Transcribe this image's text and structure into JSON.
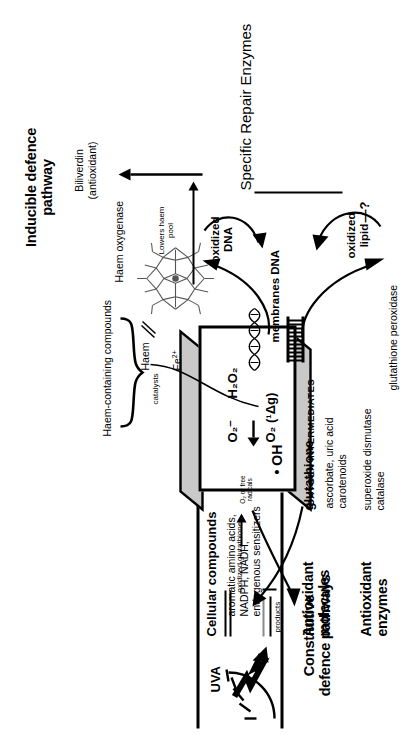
{
  "figure": {
    "kind": "biochemical-pathway-diagram",
    "title_left": "Constitutive\ndefence pathways",
    "orientation_note": "diagram rotated 90 degrees in the page"
  },
  "panel_inducible": {
    "heading_line1": "Inducible defence",
    "heading_line2": "pathway",
    "enzyme": "Haem oxygenase",
    "arrow_label_line1": "Lowers haem",
    "arrow_label_line2": "pool",
    "substrate": "Haem",
    "iron": "Fe",
    "iron_charge": "2+",
    "product_line1": "Biliverdin",
    "product_line2": "(antioxidant)",
    "source_pool": "Haem-containing compounds",
    "brace_label": "catalysts",
    "haem_structure_name": "haem-porphyrin-structure"
  },
  "panel_source": {
    "uva_label": "UVA",
    "sun_icon": "sun-with-rays-icon",
    "bolt_icon": "uva-lightning-arrow-icon",
    "heading": "Cellular compounds",
    "list": [
      "aromatic amino acids,",
      "NADPH, NADH,",
      "endogenous sensitizers"
    ]
  },
  "oxygen_box": {
    "edge_label": "OXYGEN INTERMEDIATES",
    "species": [
      {
        "formula": "H",
        "sub1": "2",
        "mid": "O",
        "sub2": "2",
        "name": "hydrogen-peroxide"
      },
      {
        "formula": "O",
        "sub": "2",
        "sup": "–",
        "name": "superoxide-anion"
      },
      {
        "formula": "O",
        "sub": "2",
        "state": "(¹Δ",
        "state_sub": "g",
        "state_close": ")",
        "name": "singlet-oxygen"
      },
      {
        "formula": "• OH",
        "name": "hydroxyl-radical"
      }
    ],
    "labels_flat": [
      "H₂O₂",
      "O₂⁻",
      "O₂ (¹Δg)",
      "• OH"
    ]
  },
  "targets": {
    "group_label": "membranes DNA",
    "membrane_icon": "lipid-bilayer-icon",
    "dna_icon": "dna-helix-icon",
    "oxidized_dna_line1": "oxidized",
    "oxidized_dna_line2": "DNA",
    "oxidized_lipid_line1": "oxidized",
    "oxidized_lipid_line2": "lipid",
    "question_mark": "—?",
    "repair_heading": "Specific Repair Enzymes"
  },
  "panel_antioxidant_molecules": {
    "heading_line1": "Antioxidant",
    "heading_line2": "molecules",
    "main": "glutathione",
    "list": [
      "ascorbate, uric acid",
      "carotenoids"
    ],
    "cycle": {
      "in_label_line1": "O₂ or free",
      "in_label_line2": "radicals",
      "out_label": "oxidized glutathione",
      "products_label": "products"
    }
  },
  "panel_antioxidant_enzymes": {
    "heading_line1": "Antioxidant",
    "heading_line2": "enzymes",
    "list": [
      "superoxide dismutase",
      "catalase"
    ],
    "peroxidase": "glutathione peroxidase"
  },
  "colors": {
    "ink": "#000000",
    "paper": "#ffffff",
    "box_shade": "#c9c9c9",
    "grey_rule": "#8a8a8a"
  }
}
